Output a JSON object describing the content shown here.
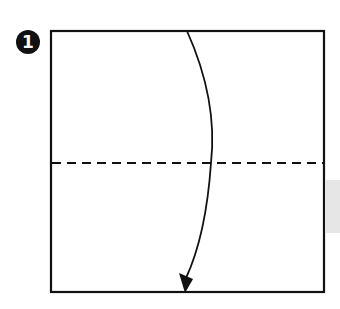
{
  "figure": {
    "step_number": "1",
    "colors": {
      "line": "#111111",
      "badge_fill": "#111111",
      "badge_text": "#ffffff",
      "side_tab": "#e6e6e6",
      "background": "#ffffff"
    },
    "square": {
      "x": 51,
      "y": 31,
      "width": 273,
      "height": 261
    },
    "valley_fold_line": {
      "y": 163,
      "style": "dashed"
    },
    "fold_arrow": {
      "direction": "down",
      "from": [
        187,
        31
      ],
      "via": [
        211,
        163
      ],
      "to": [
        185,
        292
      ]
    }
  }
}
